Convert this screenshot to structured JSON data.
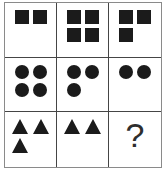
{
  "puzzle": {
    "type": "matrix-reasoning-3x3",
    "rows": 3,
    "cols": 3,
    "colors": {
      "background": "#ffffff",
      "shape": "#1b1b1b",
      "inner_grid_line": "#454545",
      "outer_border": "#8a8a8a",
      "question_mark": "#2e2e2e"
    },
    "question_mark_label": "?",
    "cells": [
      {
        "row": 1,
        "col": 1,
        "shape": "square",
        "count": 2,
        "positions": [
          "top-left",
          "top-right"
        ]
      },
      {
        "row": 1,
        "col": 2,
        "shape": "square",
        "count": 4,
        "positions": [
          "top-left",
          "top-right",
          "bottom-left",
          "bottom-right"
        ]
      },
      {
        "row": 1,
        "col": 3,
        "shape": "square",
        "count": 3,
        "positions": [
          "top-left",
          "top-right",
          "bottom-left"
        ]
      },
      {
        "row": 2,
        "col": 1,
        "shape": "circle",
        "count": 4,
        "positions": [
          "top-left",
          "top-right",
          "bottom-left",
          "bottom-right"
        ]
      },
      {
        "row": 2,
        "col": 2,
        "shape": "circle",
        "count": 3,
        "positions": [
          "top-left",
          "top-right",
          "bottom-left"
        ]
      },
      {
        "row": 2,
        "col": 3,
        "shape": "circle",
        "count": 2,
        "positions": [
          "top-left",
          "top-right"
        ]
      },
      {
        "row": 3,
        "col": 1,
        "shape": "triangle",
        "count": 3,
        "positions": [
          "top-left",
          "top-right",
          "bottom-left"
        ]
      },
      {
        "row": 3,
        "col": 2,
        "shape": "triangle",
        "count": 2,
        "positions": [
          "top-left",
          "top-right"
        ]
      },
      {
        "row": 3,
        "col": 3,
        "shape": "question-mark",
        "count": 0,
        "positions": []
      }
    ]
  }
}
